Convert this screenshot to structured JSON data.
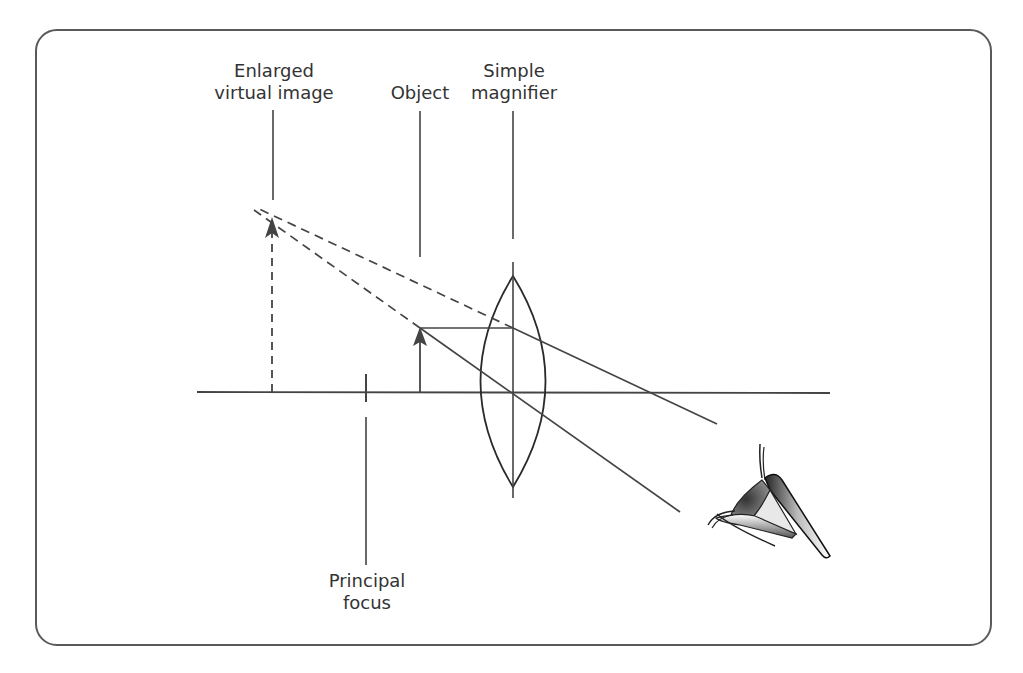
{
  "diagram": {
    "labels": {
      "virtual_image": [
        "Enlarged",
        "virtual image"
      ],
      "object": [
        "Object"
      ],
      "magnifier": [
        "Simple",
        "magnifier"
      ],
      "focus": [
        "Principal",
        "focus"
      ]
    },
    "colors": {
      "line": "#444444",
      "text": "#333333",
      "frame": "#5a5a5a"
    }
  }
}
